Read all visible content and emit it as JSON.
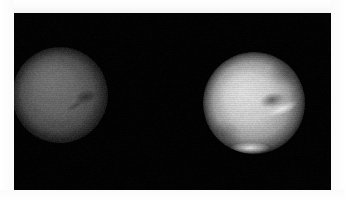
{
  "image": {
    "kind": "astronomical-observation-plate",
    "subject_count": 2,
    "background_color": "#030303",
    "page_color": "#ffffff",
    "plate": {
      "x": 14,
      "y": 13,
      "width": 317,
      "height": 177
    },
    "alt_text": "Two telescopic disks of a planet on a black background; the left disk is dim and gray, the right disk is bright with a polar cap."
  },
  "objects": [
    {
      "id": "disk-left",
      "label": "left-planet-disk",
      "center_x": 60,
      "center_y": 95,
      "radius": 47,
      "brightness": "dim",
      "peak_color": "#6e6e6e",
      "limb_color": "#151515",
      "features": [
        {
          "id": "dark-wedge",
          "label": "dark wedge marking",
          "x": 86,
          "y": 97,
          "color": "#2a2a2a"
        },
        {
          "id": "dark-streak",
          "label": "dark streak tail",
          "x": 76,
          "y": 105,
          "color": "#3a3a3a"
        },
        {
          "id": "mottled-band",
          "label": "mottled southern band",
          "x": 58,
          "y": 126,
          "color": "#4a4a4a"
        },
        {
          "id": "bright-core",
          "label": "diffuse bright core",
          "x": 52,
          "y": 80,
          "color": "#787878"
        }
      ]
    },
    {
      "id": "disk-right",
      "label": "right-planet-disk",
      "center_x": 254,
      "center_y": 103,
      "radius": 50,
      "brightness": "bright",
      "peak_color": "#dcdcdc",
      "limb_color": "#1a1a1a",
      "features": [
        {
          "id": "bright-streak",
          "label": "bright streak marking",
          "x": 282,
          "y": 109,
          "color": "#f2f2f2"
        },
        {
          "id": "dark-wedge",
          "label": "dark wedge marking",
          "x": 272,
          "y": 100,
          "color": "#555555"
        },
        {
          "id": "polar-cap",
          "label": "bright polar cap",
          "x": 250,
          "y": 148,
          "color": "#f0f0f0"
        },
        {
          "id": "bright-core",
          "label": "bright central region",
          "x": 244,
          "y": 92,
          "color": "#e2e2e2"
        },
        {
          "id": "dark-limb-ne",
          "label": "dark northeast limb",
          "x": 288,
          "y": 72,
          "color": "#3c3c3c"
        },
        {
          "id": "dark-limb-sw",
          "label": "dark southwest limb",
          "x": 222,
          "y": 135,
          "color": "#454545"
        }
      ]
    }
  ],
  "render": {
    "noise_seed": 20250601,
    "noise_amount": 14,
    "scanline_opacity": 0.06
  }
}
